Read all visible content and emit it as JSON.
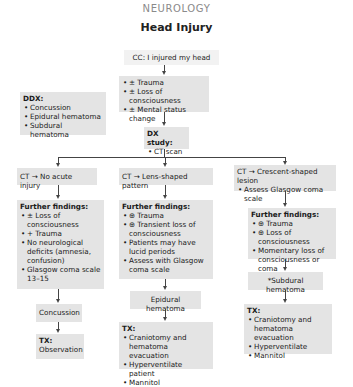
{
  "header": {
    "section": "NEUROLOGY",
    "title": "Head Injury"
  },
  "chief_complaint": "CC: I injured my head",
  "presentation": {
    "items": [
      "± Trauma",
      "± Loss of consciousness",
      "± Mental status change"
    ]
  },
  "ddx": {
    "title": "DDX:",
    "items": [
      "Concussion",
      "Epidural hematoma",
      "Subdural hematoma"
    ]
  },
  "dx_study": {
    "title": "DX study:",
    "items": [
      "CT scan"
    ]
  },
  "branches": [
    {
      "ct_result": "CT → No acute injury",
      "ct_note": "",
      "findings_title": "Further findings:",
      "findings": [
        "± Loss of consciousness",
        "+ Trauma",
        "No neurological deficits (amnesia, confusion)",
        "Glasgow coma scale 13–15"
      ],
      "diagnosis": "Concussion",
      "tx_title": "TX:",
      "tx_text": "Observation",
      "tx_items": []
    },
    {
      "ct_result": "CT → Lens-shaped pattern",
      "ct_note": "",
      "findings_title": "Further findings:",
      "findings": [
        "⊕ Trauma",
        "⊕ Transient loss of consciousness",
        "Patients may have lucid periods",
        "Assess with Glasgow coma scale"
      ],
      "diagnosis": "Epidural hematoma",
      "tx_title": "TX:",
      "tx_text": "",
      "tx_items": [
        "Craniotomy and hematoma evacuation",
        "Hyperventilate patient",
        "Mannitol"
      ]
    },
    {
      "ct_result": "CT → Crescent-shaped lesion",
      "ct_note": "Assess Glasgow coma scale",
      "findings_title": "Further findings:",
      "findings": [
        "⊕ Trauma",
        "⊕ Loss of consciousness",
        "Momentary loss of consciousness or coma"
      ],
      "diagnosis": "*Subdural hematoma",
      "tx_title": "TX:",
      "tx_text": "",
      "tx_items": [
        "Craniotomy and hematoma evacuation",
        "Hyperventilate",
        "Mannitol"
      ]
    }
  ],
  "colors": {
    "box_fill": "#e4e4e4",
    "line": "#444444",
    "section_header": "#8a8a8a"
  }
}
